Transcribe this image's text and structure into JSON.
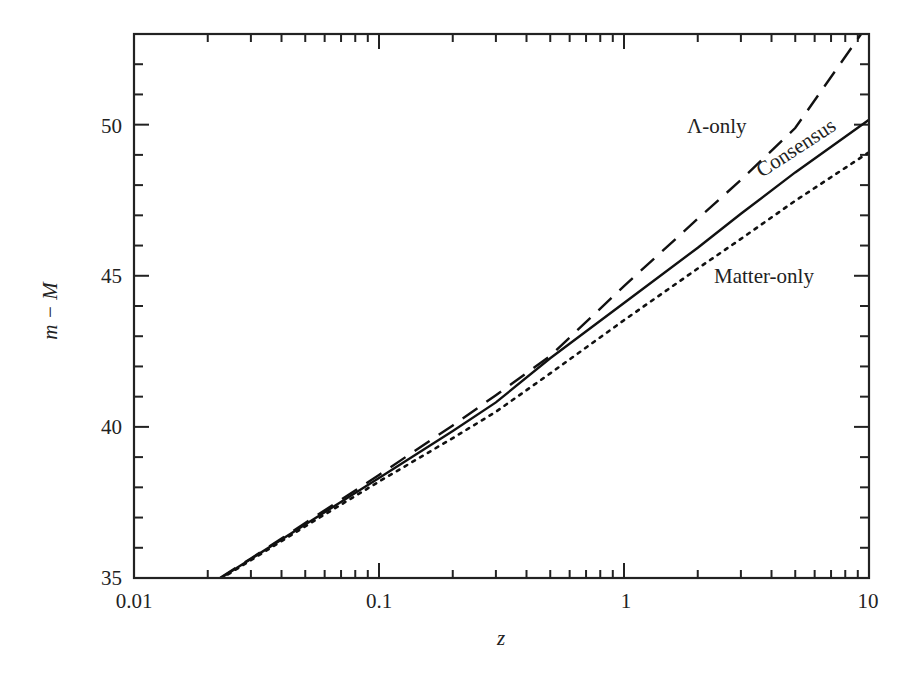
{
  "chart_data": {
    "type": "line",
    "title": "",
    "xlabel": "z",
    "ylabel": "m − M",
    "xscale": "log",
    "xlim": [
      0.01,
      10
    ],
    "ylim": [
      35,
      53
    ],
    "grid": false,
    "legend": "inline labels",
    "x_ticks": [
      0.01,
      0.1,
      1,
      10
    ],
    "x_tick_labels": [
      "0.01",
      "0.1",
      "1",
      "10"
    ],
    "y_ticks": [
      35,
      40,
      45,
      50
    ],
    "y_tick_labels": [
      "35",
      "40",
      "45",
      "50"
    ],
    "x": [
      0.0225,
      0.03,
      0.05,
      0.1,
      0.2,
      0.3,
      0.5,
      1,
      2,
      3,
      5,
      10
    ],
    "series": [
      {
        "name": "Λ-only",
        "style": "dashed",
        "label_text": "Λ-only",
        "values": [
          35.01,
          35.65,
          36.82,
          38.41,
          40.05,
          41.05,
          42.35,
          44.66,
          46.89,
          48.17,
          49.89,
          53.37
        ]
      },
      {
        "name": "Consensus",
        "style": "solid",
        "label_text": "Consensus",
        "values": [
          34.99,
          35.63,
          36.77,
          38.31,
          39.86,
          40.81,
          42.27,
          44.1,
          45.93,
          47.05,
          48.42,
          50.16
        ]
      },
      {
        "name": "Matter-only",
        "style": "dotted",
        "label_text": "Matter-only",
        "values": [
          34.96,
          35.59,
          36.71,
          38.19,
          39.63,
          40.5,
          41.77,
          43.53,
          45.24,
          46.22,
          47.48,
          49.09
        ]
      }
    ]
  }
}
